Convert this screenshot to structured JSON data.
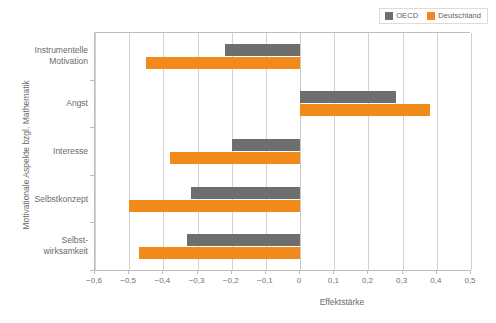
{
  "chart_data": {
    "type": "bar",
    "orientation": "horizontal",
    "title": "",
    "xlabel": "Effektstärke",
    "ylabel": "Motivationale Aspekte bzgl. Mathematik",
    "xlim": [
      -0.6,
      0.5
    ],
    "xticks": [
      "−0,6",
      "−0,5",
      "−0,4",
      "−0,3",
      "−0,2",
      "−0,1",
      "0",
      "0,1",
      "0,2",
      "0,3",
      "0,4",
      "0,5"
    ],
    "xtick_values": [
      -0.6,
      -0.5,
      -0.4,
      -0.3,
      -0.2,
      -0.1,
      0,
      0.1,
      0.2,
      0.3,
      0.4,
      0.5
    ],
    "grid": true,
    "legend_position": "top-right",
    "categories": [
      "Instrumentelle\nMotivation",
      "Angst",
      "Interesse",
      "Selbstkonzept",
      "Selbst-\nwirksamkeit"
    ],
    "category_lines": [
      [
        "Instrumentelle",
        "Motivation"
      ],
      [
        "Angst"
      ],
      [
        "Interesse"
      ],
      [
        "Selbstkonzept"
      ],
      [
        "Selbst-",
        "wirksamkeit"
      ]
    ],
    "series": [
      {
        "name": "OECD",
        "color": "#6e6e6e",
        "values": [
          -0.22,
          0.28,
          -0.2,
          -0.32,
          -0.33
        ]
      },
      {
        "name": "Deutschland",
        "color": "#f18a1a",
        "values": [
          -0.45,
          0.38,
          -0.38,
          -0.5,
          -0.47
        ]
      }
    ]
  },
  "legend": {
    "items": [
      {
        "label": "OECD",
        "color": "#6e6e6e"
      },
      {
        "label": "Deutschland",
        "color": "#f18a1a"
      }
    ]
  },
  "axes": {
    "x_title": "Effektstärke",
    "y_title": "Motivationale Aspekte bzgl. Mathematik"
  }
}
